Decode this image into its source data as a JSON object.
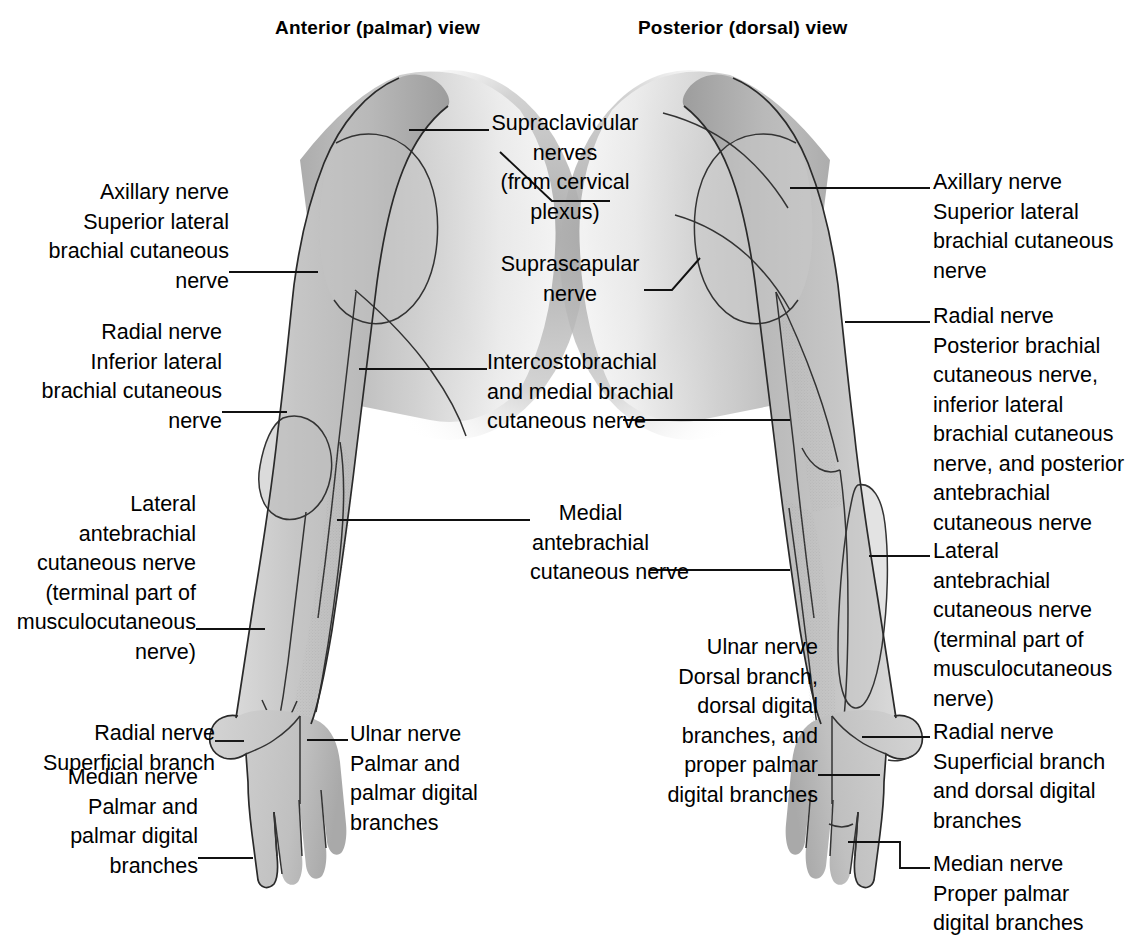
{
  "figure": {
    "background_color": "#ffffff",
    "ink_color": "#000000",
    "skin_fill_light": "#cccccc",
    "skin_fill_mid": "#b5b5b5",
    "skin_fill_dark": "#9a9a9a",
    "outline_color": "#2a2a2a"
  },
  "titles": {
    "anterior": "Anterior (palmar) view",
    "posterior": "Posterior (dorsal) view"
  },
  "labels": {
    "left": [
      {
        "id": "axillary-nerve-left",
        "align": "right",
        "lines": [
          "Axillary nerve",
          "Superior lateral",
          "brachial cutaneous",
          "nerve"
        ]
      },
      {
        "id": "radial-nerve-left",
        "align": "right",
        "lines": [
          "Radial nerve",
          "Inferior lateral",
          "brachial cutaneous",
          "nerve"
        ]
      },
      {
        "id": "lateral-antebrachial-left",
        "align": "right",
        "lines": [
          "Lateral",
          "antebrachial",
          "cutaneous nerve",
          "(terminal part of",
          "musculocutaneous",
          "nerve)"
        ]
      },
      {
        "id": "radial-superficial-left",
        "align": "right",
        "lines": [
          "Radial nerve",
          "Superficial branch"
        ]
      },
      {
        "id": "median-nerve-left",
        "align": "right",
        "lines": [
          "Median nerve",
          "Palmar and",
          "palmar digital",
          "branches"
        ]
      }
    ],
    "center": [
      {
        "id": "supraclavicular-nerves",
        "align": "center",
        "lines": [
          "Supraclavicular",
          "nerves",
          "(from cervical",
          "plexus)"
        ]
      },
      {
        "id": "suprascapular-nerve",
        "align": "center",
        "lines": [
          "Suprascapular",
          "nerve"
        ]
      },
      {
        "id": "intercostobrachial-nerve",
        "align": "center",
        "lines": [
          "Intercostobrachial",
          "and medial brachial",
          "cutaneous nerve"
        ]
      },
      {
        "id": "medial-antebrachial-nerve",
        "align": "center",
        "lines": [
          "Medial",
          "antebrachial",
          "cutaneous nerve"
        ]
      },
      {
        "id": "ulnar-nerve-palmar",
        "align": "left",
        "lines": [
          "Ulnar nerve",
          "Palmar and",
          "palmar digital",
          "branches"
        ]
      },
      {
        "id": "ulnar-nerve-dorsal",
        "align": "right",
        "lines": [
          "Ulnar nerve",
          "Dorsal branch,",
          "dorsal digital",
          "branches, and",
          "proper palmar",
          "digital branches"
        ]
      }
    ],
    "right": [
      {
        "id": "axillary-nerve-right",
        "align": "left",
        "lines": [
          "Axillary nerve",
          "Superior lateral",
          "brachial cutaneous",
          "nerve"
        ]
      },
      {
        "id": "radial-nerve-right",
        "align": "left",
        "lines": [
          "Radial nerve",
          "Posterior brachial",
          "cutaneous nerve,",
          "inferior lateral",
          "brachial cutaneous",
          "nerve, and posterior",
          "antebrachial",
          "cutaneous nerve"
        ]
      },
      {
        "id": "lateral-antebrachial-right",
        "align": "left",
        "lines": [
          "Lateral",
          "antebrachial",
          "cutaneous nerve",
          "(terminal part of",
          "musculocutaneous",
          "nerve)"
        ]
      },
      {
        "id": "radial-superficial-right",
        "align": "left",
        "lines": [
          "Radial nerve",
          "Superficial branch",
          "and dorsal digital",
          "branches"
        ]
      },
      {
        "id": "median-nerve-right",
        "align": "left",
        "lines": [
          "Median nerve",
          "Proper palmar",
          "digital branches"
        ]
      }
    ]
  }
}
